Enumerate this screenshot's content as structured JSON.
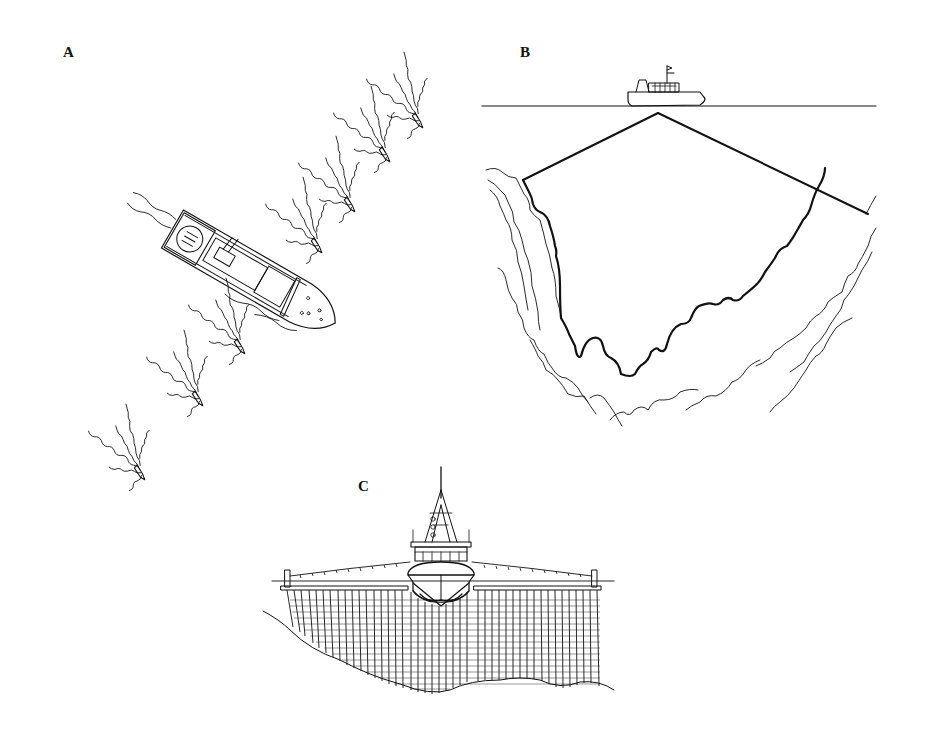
{
  "figure": {
    "background": "#ffffff",
    "ink_color": "#111111",
    "panels": [
      {
        "label": "A",
        "description": "Top-down view of a mother ship with a line of small boats (pirogues) in diagonal formation, each trailing wakes"
      },
      {
        "label": "B",
        "description": "Side view of a vessel at the sea surface with two lines descending to a deep seabed canyon"
      },
      {
        "label": "C",
        "description": "Front view of a ship with outrigger booms supporting a wide curtain of vertical lines/nets down to the seabed"
      }
    ]
  }
}
